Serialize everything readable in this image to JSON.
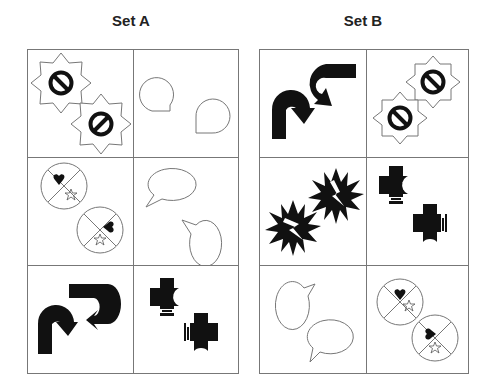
{
  "sets": [
    {
      "title": "Set A",
      "cells": [
        {
          "row": 0,
          "col": 0,
          "content": "two-no-entry-starbursts"
        },
        {
          "row": 0,
          "col": 1,
          "content": "two-round-speech-bubbles-outline"
        },
        {
          "row": 1,
          "col": 0,
          "content": "two-quartered-circles-heart-star"
        },
        {
          "row": 1,
          "col": 1,
          "content": "two-oval-speech-bubbles-outline"
        },
        {
          "row": 2,
          "col": 0,
          "content": "two-curved-black-arrows"
        },
        {
          "row": 2,
          "col": 1,
          "content": "two-black-crosses-with-crescent-and-arrow"
        }
      ]
    },
    {
      "title": "Set B",
      "cells": [
        {
          "row": 0,
          "col": 0,
          "content": "two-curved-black-arrows"
        },
        {
          "row": 0,
          "col": 1,
          "content": "two-no-entry-starbursts"
        },
        {
          "row": 1,
          "col": 0,
          "content": "two-black-explosions-with-lightning"
        },
        {
          "row": 1,
          "col": 1,
          "content": "two-black-crosses-with-crescent-and-arrow"
        },
        {
          "row": 2,
          "col": 0,
          "content": "two-oval-speech-bubbles-outline"
        },
        {
          "row": 2,
          "col": 1,
          "content": "two-quartered-circles-heart-star"
        }
      ]
    }
  ],
  "colors": {
    "line": "#777777",
    "fill": "#111111",
    "title": "#222222"
  }
}
